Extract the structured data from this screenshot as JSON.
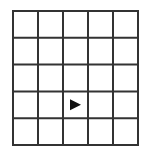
{
  "grid": {
    "rows": 5,
    "cols": 5,
    "line_color": "#333333",
    "background": "#ffffff"
  },
  "markers": [
    {
      "type": "triangle",
      "direction": "right",
      "row": 4,
      "col": 3,
      "color": "#111111"
    }
  ]
}
